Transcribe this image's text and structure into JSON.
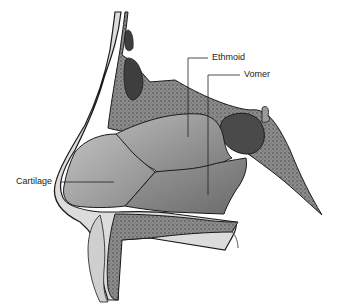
{
  "figure": {
    "labels": {
      "ethmoid": "Ethmoid",
      "vomer": "Vomer",
      "cartilage": "Cartilage"
    },
    "colors": {
      "outline": "#1a1a1a",
      "skin": "#d9d9d9",
      "bone_dark": "#6e6e6e",
      "ethmoid_fill": "#9a9a9a",
      "vomer_fill": "#8a8a8a",
      "cartilage_fill": "#a8a8a8",
      "sinus": "#5a5a5a"
    }
  }
}
